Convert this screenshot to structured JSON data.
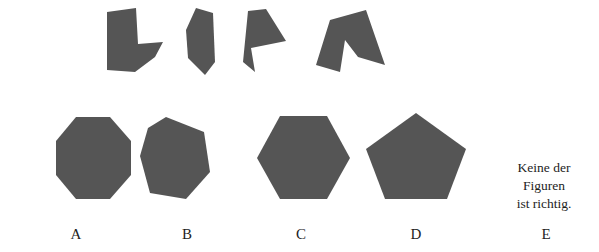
{
  "figure": {
    "kind": "shape-assembly-puzzle",
    "background_color": "#ffffff",
    "shape_fill_color": "#555555",
    "text_color": "#1d1d1d",
    "pieces_caption": "",
    "pieces": [
      {
        "id": "piece-1",
        "name": "chevron-piece",
        "points": "107,12 136,8 138,44 163,42 155,57 135,72 107,70"
      },
      {
        "id": "piece-2",
        "name": "kite-piece",
        "points": "196,8 213,13 215,62 205,75 188,58 186,30"
      },
      {
        "id": "piece-3",
        "name": "dart-piece",
        "points": "248,11 266,9 286,41 251,48 255,72 243,62"
      },
      {
        "id": "piece-4",
        "name": "tent-piece",
        "points": "330,20 366,10 385,65 358,57 345,40 340,72 316,65"
      }
    ],
    "options": [
      {
        "id": "option-a",
        "label": "A",
        "shape": "octagon",
        "sides": 8,
        "points": "56,141 76,117 110,117 131,141 131,175 110,199 76,199 56,175"
      },
      {
        "id": "option-b",
        "label": "B",
        "shape": "heptagon",
        "sides": 7,
        "points": "166,117 204,132 210,172 186,199 150,193 140,156 148,128"
      },
      {
        "id": "option-c",
        "label": "C",
        "shape": "hexagon",
        "sides": 6,
        "points": "280,116 327,116 350,158 327,199 280,199 257,158"
      },
      {
        "id": "option-d",
        "label": "D",
        "shape": "pentagon",
        "sides": 5,
        "points": "416,113 466,149 447,199 385,199 366,149"
      },
      {
        "id": "option-e",
        "label": "E",
        "shape": "text",
        "text_lines": [
          "Keine der",
          "Figuren",
          "ist richtig."
        ]
      }
    ]
  }
}
